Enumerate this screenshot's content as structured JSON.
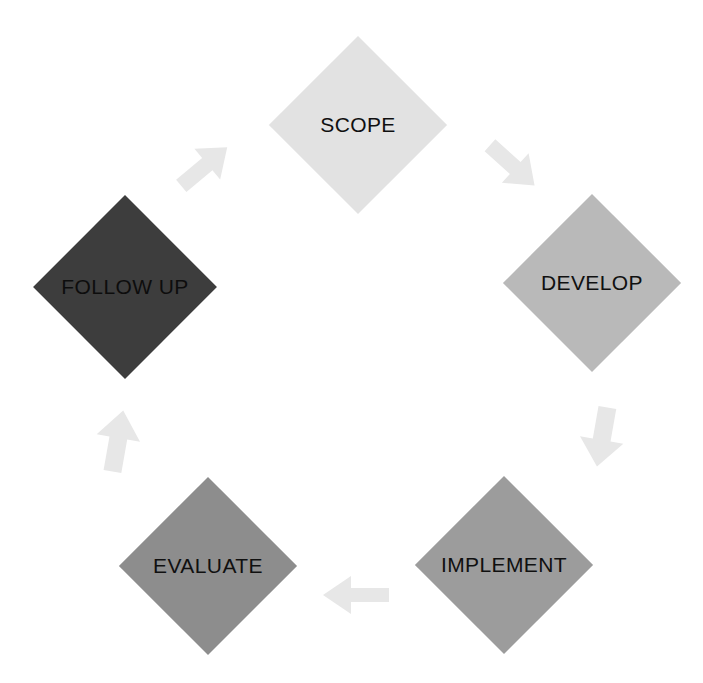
{
  "diagram": {
    "type": "cycle",
    "direction": "clockwise",
    "background_color": "#ffffff",
    "arrow_color": "#e7e7e7",
    "node_count": 5,
    "arrow_count": 5,
    "nodes": [
      {
        "id": "scope",
        "label": "SCOPE",
        "shape": "diamond",
        "fill": "#e2e2e2",
        "text_color": "#101010",
        "center_x": 358,
        "center_y": 125,
        "size": 126,
        "order": 1
      },
      {
        "id": "develop",
        "label": "DEVELOP",
        "shape": "diamond",
        "fill": "#b9b9b9",
        "text_color": "#101010",
        "center_x": 592,
        "center_y": 283,
        "size": 126,
        "order": 2
      },
      {
        "id": "implement",
        "label": "IMPLEMENT",
        "shape": "diamond",
        "fill": "#9c9c9c",
        "text_color": "#101010",
        "center_x": 504,
        "center_y": 565,
        "size": 126,
        "order": 3
      },
      {
        "id": "evaluate",
        "label": "EVALUATE",
        "shape": "diamond",
        "fill": "#8d8d8d",
        "text_color": "#101010",
        "center_x": 208,
        "center_y": 566,
        "size": 126,
        "order": 4
      },
      {
        "id": "follow-up",
        "label": "FOLLOW UP",
        "shape": "diamond",
        "fill": "#3d3d3d",
        "text_color": "#0d0d0d",
        "center_x": 125,
        "center_y": 287,
        "size": 130,
        "order": 5
      }
    ],
    "arrows": [
      {
        "id": "arrow-follow-up-to-scope",
        "from": "follow-up",
        "to": "scope",
        "direction": "up-right",
        "rotation_deg": -40,
        "center_x": 205,
        "center_y": 166,
        "fill": "#e7e7e7"
      },
      {
        "id": "arrow-scope-to-develop",
        "from": "scope",
        "to": "develop",
        "direction": "down-right",
        "rotation_deg": 42,
        "center_x": 513,
        "center_y": 166,
        "fill": "#e7e7e7"
      },
      {
        "id": "arrow-develop-to-implement",
        "from": "develop",
        "to": "implement",
        "direction": "down",
        "rotation_deg": 100,
        "center_x": 602,
        "center_y": 438,
        "fill": "#e7e7e7"
      },
      {
        "id": "arrow-implement-to-evaluate",
        "from": "implement",
        "to": "evaluate",
        "direction": "left",
        "rotation_deg": 180,
        "center_x": 355,
        "center_y": 595,
        "fill": "#e7e7e7"
      },
      {
        "id": "arrow-evaluate-to-follow-up",
        "from": "evaluate",
        "to": "follow-up",
        "direction": "up",
        "rotation_deg": -80,
        "center_x": 118,
        "center_y": 440,
        "fill": "#e7e7e7"
      }
    ]
  }
}
